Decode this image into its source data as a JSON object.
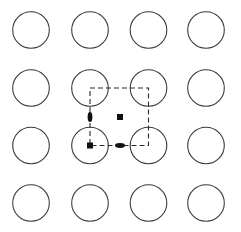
{
  "diagram": {
    "type": "2d-lattice-symmetry",
    "canvas": {
      "width": 241,
      "height": 232
    },
    "colors": {
      "circle_stroke": "#3a3a3a",
      "cell_stroke": "#2a2a2a",
      "marker_fill": "#111111",
      "background": "#ffffff"
    },
    "lattice": {
      "rows": 4,
      "cols": 4,
      "col_centers": [
        31,
        90,
        148.5,
        206
      ],
      "row_centers": [
        30,
        88,
        145.5,
        203
      ],
      "radius": 18.3
    },
    "unit_cell": {
      "x1": 90,
      "y1": 88,
      "x2": 148.5,
      "y2": 145.5,
      "style": "dashed"
    },
    "symmetry_markers": [
      {
        "shape": "square",
        "name": "twofold-axis-square-center",
        "x": 120,
        "y": 117,
        "size": 6
      },
      {
        "shape": "square",
        "name": "twofold-axis-square-corner",
        "x": 90,
        "y": 145.5,
        "size": 6
      },
      {
        "shape": "lens-vertical",
        "name": "twofold-axis-lens-left-edge",
        "x": 90,
        "y": 117,
        "rx": 2.4,
        "ry": 5
      },
      {
        "shape": "lens-horizontal",
        "name": "twofold-axis-lens-bottom-edge",
        "x": 120,
        "y": 145.5,
        "rx": 2.4,
        "ry": 5
      }
    ]
  }
}
